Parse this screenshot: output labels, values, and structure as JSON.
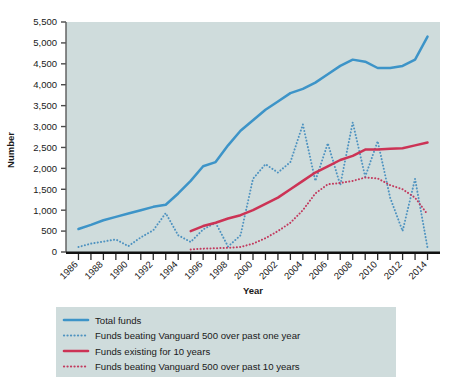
{
  "chart_data": {
    "type": "line",
    "title": "",
    "xlabel": "Year",
    "ylabel": "Number",
    "xlim": [
      1985,
      2015
    ],
    "ylim": [
      0,
      5500
    ],
    "ytick_labels": [
      "0",
      "500",
      "1,000",
      "1,500",
      "2,000",
      "2,500",
      "3,000",
      "3,500",
      "4,000",
      "4,500",
      "5,000",
      "5,500"
    ],
    "ytick_values": [
      0,
      500,
      1000,
      1500,
      2000,
      2500,
      3000,
      3500,
      4000,
      4500,
      5000,
      5500
    ],
    "xtick_labels": [
      "1986",
      "1988",
      "1990",
      "1992",
      "1994",
      "1996",
      "1998",
      "2000",
      "2002",
      "2004",
      "2006",
      "2008",
      "2010",
      "2012",
      "2014"
    ],
    "xtick_values": [
      1986,
      1988,
      1990,
      1992,
      1994,
      1996,
      1998,
      2000,
      2002,
      2004,
      2006,
      2008,
      2010,
      2012,
      2014
    ],
    "grid": false,
    "legend_position": "below",
    "plot_background": "#cfdcdc",
    "series": [
      {
        "name": "Total funds",
        "color": "#3d94c8",
        "style": "solid",
        "x": [
          1986,
          1987,
          1988,
          1989,
          1990,
          1991,
          1992,
          1993,
          1994,
          1995,
          1996,
          1997,
          1998,
          1999,
          2000,
          2001,
          2002,
          2003,
          2004,
          2005,
          2006,
          2007,
          2008,
          2009,
          2010,
          2011,
          2012,
          2013,
          2014
        ],
        "values": [
          550,
          650,
          760,
          840,
          920,
          1000,
          1080,
          1130,
          1400,
          1700,
          2050,
          2150,
          2550,
          2900,
          3150,
          3400,
          3600,
          3800,
          3900,
          4050,
          4250,
          4450,
          4600,
          4550,
          4400,
          4400,
          4450,
          4600,
          5150
        ]
      },
      {
        "name": "Funds beating Vanguard 500 over past one year",
        "color": "#4f93c0",
        "style": "dotted",
        "x": [
          1986,
          1987,
          1988,
          1989,
          1990,
          1991,
          1992,
          1993,
          1994,
          1995,
          1996,
          1997,
          1998,
          1999,
          2000,
          2001,
          2002,
          2003,
          2004,
          2005,
          2006,
          2007,
          2008,
          2009,
          2010,
          2011,
          2012,
          2013,
          2014
        ],
        "values": [
          120,
          200,
          250,
          300,
          140,
          350,
          520,
          930,
          400,
          240,
          540,
          700,
          130,
          400,
          1750,
          2100,
          1900,
          2150,
          3050,
          1700,
          2600,
          1600,
          3100,
          1800,
          2650,
          1300,
          500,
          1750,
          100
        ]
      },
      {
        "name": "Funds existing for 10 years",
        "color": "#cc3355",
        "style": "solid",
        "x": [
          1995,
          1996,
          1997,
          1998,
          1999,
          2000,
          2001,
          2002,
          2003,
          2004,
          2005,
          2006,
          2007,
          2008,
          2009,
          2010,
          2011,
          2012,
          2013,
          2014
        ],
        "values": [
          500,
          620,
          700,
          800,
          880,
          1000,
          1150,
          1300,
          1500,
          1700,
          1900,
          2050,
          2200,
          2300,
          2450,
          2450,
          2470,
          2480,
          2550,
          2620
        ]
      },
      {
        "name": "Funds beating Vanguard 500 over past 10 years",
        "color": "#c23a5e",
        "style": "dotted",
        "x": [
          1995,
          1996,
          1997,
          1998,
          1999,
          2000,
          2001,
          2002,
          2003,
          2004,
          2005,
          2006,
          2007,
          2008,
          2009,
          2010,
          2011,
          2012,
          2013,
          2014
        ],
        "values": [
          60,
          80,
          90,
          100,
          120,
          200,
          330,
          500,
          700,
          1000,
          1400,
          1620,
          1650,
          1700,
          1780,
          1760,
          1600,
          1500,
          1300,
          900
        ]
      }
    ]
  },
  "legend": {
    "items": [
      {
        "label": "Total funds",
        "color": "#3d94c8",
        "style": "solid"
      },
      {
        "label": "Funds beating Vanguard 500 over past one year",
        "color": "#4f93c0",
        "style": "dotted"
      },
      {
        "label": "Funds existing for 10 years",
        "color": "#cc3355",
        "style": "solid"
      },
      {
        "label": "Funds beating Vanguard 500 over past 10 years",
        "color": "#c23a5e",
        "style": "dotted"
      }
    ]
  },
  "axis_titles": {
    "x": "Year",
    "y": "Number"
  }
}
